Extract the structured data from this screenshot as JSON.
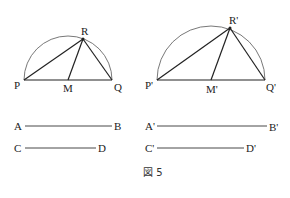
{
  "figure": {
    "caption": "図 5",
    "left": {
      "labels": {
        "P": "P",
        "Q": "Q",
        "R": "R",
        "M": "M"
      },
      "points": {
        "P": [
          24,
          80
        ],
        "Q": [
          112,
          80
        ],
        "R": [
          83,
          39
        ],
        "M": [
          68,
          80
        ]
      },
      "circle": {
        "cx": 68,
        "cy": 80,
        "r": 44
      }
    },
    "right": {
      "labels": {
        "P": "P'",
        "Q": "Q'",
        "R": "R'",
        "M": "M'"
      },
      "points": {
        "P": [
          157,
          80
        ],
        "Q": [
          265,
          80
        ],
        "R": [
          230,
          28
        ],
        "M": [
          211,
          80
        ]
      },
      "circle": {
        "cx": 211,
        "cy": 80,
        "r": 54
      }
    },
    "segments": [
      {
        "start": "A",
        "end": "B",
        "x1": 25,
        "x2": 112,
        "y": 126
      },
      {
        "start": "C",
        "end": "D",
        "x1": 25,
        "x2": 96,
        "y": 148
      },
      {
        "start": "A'",
        "end": "B'",
        "x1": 157,
        "x2": 267,
        "y": 126
      },
      {
        "start": "C'",
        "end": "D'",
        "x1": 157,
        "x2": 244,
        "y": 148
      }
    ]
  }
}
